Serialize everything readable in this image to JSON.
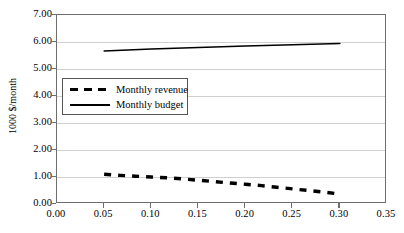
{
  "chart_data": {
    "type": "line",
    "title": "",
    "xlabel": "",
    "ylabel": "1000 $/month",
    "xlim": [
      0.0,
      0.35
    ],
    "ylim": [
      0.0,
      7.0
    ],
    "xticks": [
      "0.00",
      "0.05",
      "0.10",
      "0.15",
      "0.20",
      "0.25",
      "0.30",
      "0.35"
    ],
    "xtick_values": [
      0.0,
      0.05,
      0.1,
      0.15,
      0.2,
      0.25,
      0.3,
      0.35
    ],
    "yticks": [
      "0.00",
      "1.00",
      "2.00",
      "3.00",
      "4.00",
      "5.00",
      "6.00",
      "7.00"
    ],
    "ytick_values": [
      0.0,
      1.0,
      2.0,
      3.0,
      4.0,
      5.0,
      6.0,
      7.0
    ],
    "grid": "horizontal",
    "legend_position": "upper-left-inside",
    "series": [
      {
        "name": "Monthly revenue",
        "style": "dashed",
        "color": "#000000",
        "x": [
          0.05,
          0.067,
          0.083,
          0.1,
          0.117,
          0.133,
          0.15,
          0.167,
          0.183,
          0.2,
          0.217,
          0.233,
          0.25,
          0.267,
          0.283,
          0.3
        ],
        "values": [
          1.1,
          1.06,
          1.03,
          1.0,
          0.97,
          0.93,
          0.88,
          0.83,
          0.78,
          0.73,
          0.68,
          0.62,
          0.56,
          0.5,
          0.44,
          0.37
        ]
      },
      {
        "name": "Monthly budget",
        "style": "solid",
        "color": "#000000",
        "x": [
          0.05,
          0.1,
          0.15,
          0.2,
          0.25,
          0.3
        ],
        "values": [
          5.67,
          5.74,
          5.8,
          5.85,
          5.9,
          5.94
        ]
      }
    ]
  },
  "legend": {
    "items": [
      {
        "label": "Monthly revenue",
        "style": "dashed"
      },
      {
        "label": "Monthly budget",
        "style": "solid"
      }
    ]
  },
  "axes": {
    "y_title": "1000 $/month"
  },
  "colors": {
    "series": "#000000",
    "gridline": "#d0d0d0",
    "frame": "#6e6e6e",
    "legend_border": "#555555",
    "background": "#ffffff"
  }
}
